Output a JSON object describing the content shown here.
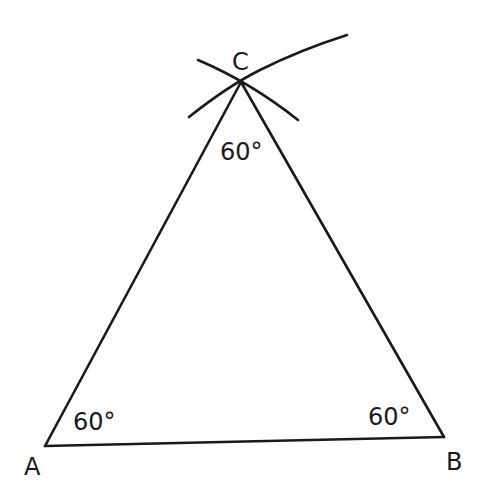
{
  "diagram": {
    "vertices": [
      {
        "id": "A",
        "label": "A",
        "x": 45,
        "y": 446,
        "angle_label": "60°"
      },
      {
        "id": "B",
        "label": "B",
        "x": 444,
        "y": 437,
        "angle_label": "60°"
      },
      {
        "id": "C",
        "label": "C",
        "x": 241,
        "y": 82,
        "angle_label": "60°"
      }
    ],
    "labels": {
      "A": "A",
      "B": "B",
      "C": "C",
      "angle_A": "60°",
      "angle_B": "60°",
      "angle_C": "60°"
    },
    "construction_arcs": 2,
    "stroke_color": "#1a1a1a",
    "background": "#ffffff"
  }
}
